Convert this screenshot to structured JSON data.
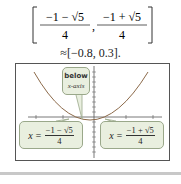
{
  "interval": {
    "left_numerator": "−1 − √5",
    "right_numerator": "−1 + √5",
    "denominator": "4",
    "approximation": "≈[−0.8, 0.3]."
  },
  "graph": {
    "callout_top_line1": "below",
    "callout_top_line2": "x-axis",
    "left_root": {
      "var": "x =",
      "numerator": "−1 − √5",
      "denominator": "4"
    },
    "right_root": {
      "var": "x =",
      "numerator": "−1 + √5",
      "denominator": "4"
    },
    "colors": {
      "callout_fill": "#e9efdf",
      "curve": "#8c6a4a",
      "axis": "#555555"
    }
  }
}
